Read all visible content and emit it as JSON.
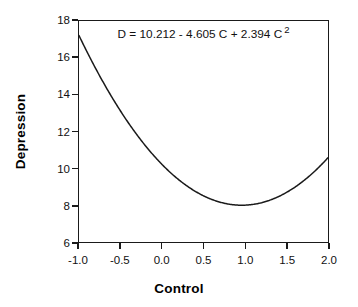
{
  "chart_data": {
    "type": "line",
    "title": "",
    "subtitle": "",
    "xlabel": "Control",
    "ylabel": "Depression",
    "xlim": [
      -1.0,
      2.0
    ],
    "ylim": [
      6,
      18
    ],
    "grid": false,
    "legend": null,
    "legend_position": "none",
    "annotations": [
      {
        "name": "regression-equation",
        "text_full": "D = 10.212 - 4.605 C + 2.394 C 2",
        "text_base": "D = 10.212 - 4.605 C + 2.394 C",
        "text_superscript": "2",
        "x": 0.5,
        "y": 17.4
      }
    ],
    "xticks": [
      -1.0,
      -0.5,
      0.0,
      0.5,
      1.0,
      1.5,
      2.0
    ],
    "xticklabels": [
      "-1.0",
      "-0.5",
      "0.0",
      "0.5",
      "1.0",
      "1.5",
      "2.0"
    ],
    "yticks": [
      6,
      8,
      10,
      12,
      14,
      16,
      18
    ],
    "yticklabels": [
      "6",
      "8",
      "10",
      "12",
      "14",
      "16",
      "18"
    ],
    "equation_coefficients": {
      "intercept": 10.212,
      "linear": -4.605,
      "quadratic": 2.394
    },
    "series": [
      {
        "name": "fitted-quadratic-curve",
        "color": "#1a1a1a",
        "x": [
          -1.0,
          -0.9,
          -0.8,
          -0.7,
          -0.6,
          -0.5,
          -0.4,
          -0.3,
          -0.2,
          -0.1,
          0.0,
          0.1,
          0.2,
          0.3,
          0.4,
          0.5,
          0.6,
          0.7,
          0.8,
          0.9,
          1.0,
          1.1,
          1.2,
          1.3,
          1.4,
          1.5,
          1.6,
          1.7,
          1.8,
          1.9,
          2.0
        ],
        "values": [
          17.211,
          16.331,
          15.498,
          14.714,
          13.978,
          13.29,
          12.649,
          12.057,
          11.512,
          11.016,
          10.212,
          9.775,
          9.442,
          9.157,
          8.92,
          8.732,
          8.591,
          8.498,
          8.453,
          8.456,
          8.001,
          8.296,
          8.46,
          8.672,
          8.932,
          9.24,
          9.596,
          10.0,
          10.452,
          10.952,
          10.578
        ]
      }
    ]
  },
  "axes": {
    "x_title": "Control",
    "y_title": "Depression"
  }
}
